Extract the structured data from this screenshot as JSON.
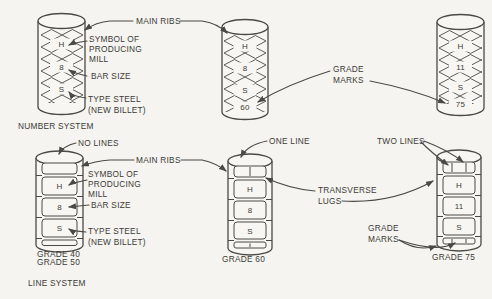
{
  "colors": {
    "background": "#f5f4f0",
    "line": "#4a4a45",
    "text": "#3b3b37",
    "bar_fill": "#f7f6f2"
  },
  "top_section": {
    "system_label": "NUMBER SYSTEM",
    "labels": {
      "main_ribs": "MAIN RIBS",
      "symbol_lines": [
        "SYMBOL OF",
        "PRODUCING",
        "MILL"
      ],
      "bar_size": "BAR SIZE",
      "type_steel_lines": [
        "TYPE STEEL",
        "(NEW BILLET)"
      ],
      "grade_marks_lines": [
        "GRADE",
        "MARKS"
      ]
    },
    "bars": [
      {
        "marks": [
          "H",
          "8",
          "S"
        ]
      },
      {
        "marks": [
          "H",
          "8",
          "S",
          "60"
        ]
      },
      {
        "marks": [
          "H",
          "11",
          "S",
          "75"
        ]
      }
    ]
  },
  "bottom_section": {
    "system_label": "LINE SYSTEM",
    "labels": {
      "no_lines": "NO LINES",
      "main_ribs": "MAIN RIBS",
      "symbol_lines": [
        "SYMBOL OF",
        "PRODUCING",
        "MILL"
      ],
      "bar_size": "BAR SIZE",
      "type_steel_lines": [
        "TYPE STEEL",
        "(NEW BILLET)"
      ],
      "one_line": "ONE LINE",
      "two_lines": "TWO LINES",
      "transverse_lugs_lines": [
        "TRANSVERSE",
        "LUGS"
      ],
      "grade_marks_lines": [
        "GRADE",
        "MARKS"
      ]
    },
    "bars": [
      {
        "caption_lines": [
          "GRADE 40",
          "GRADE 50"
        ],
        "marks": [
          "H",
          "8",
          "S"
        ]
      },
      {
        "caption_lines": [
          "GRADE 60"
        ],
        "marks": [
          "H",
          "8",
          "S"
        ]
      },
      {
        "caption_lines": [
          "GRADE 75"
        ],
        "marks": [
          "H",
          "11",
          "S"
        ]
      }
    ]
  }
}
